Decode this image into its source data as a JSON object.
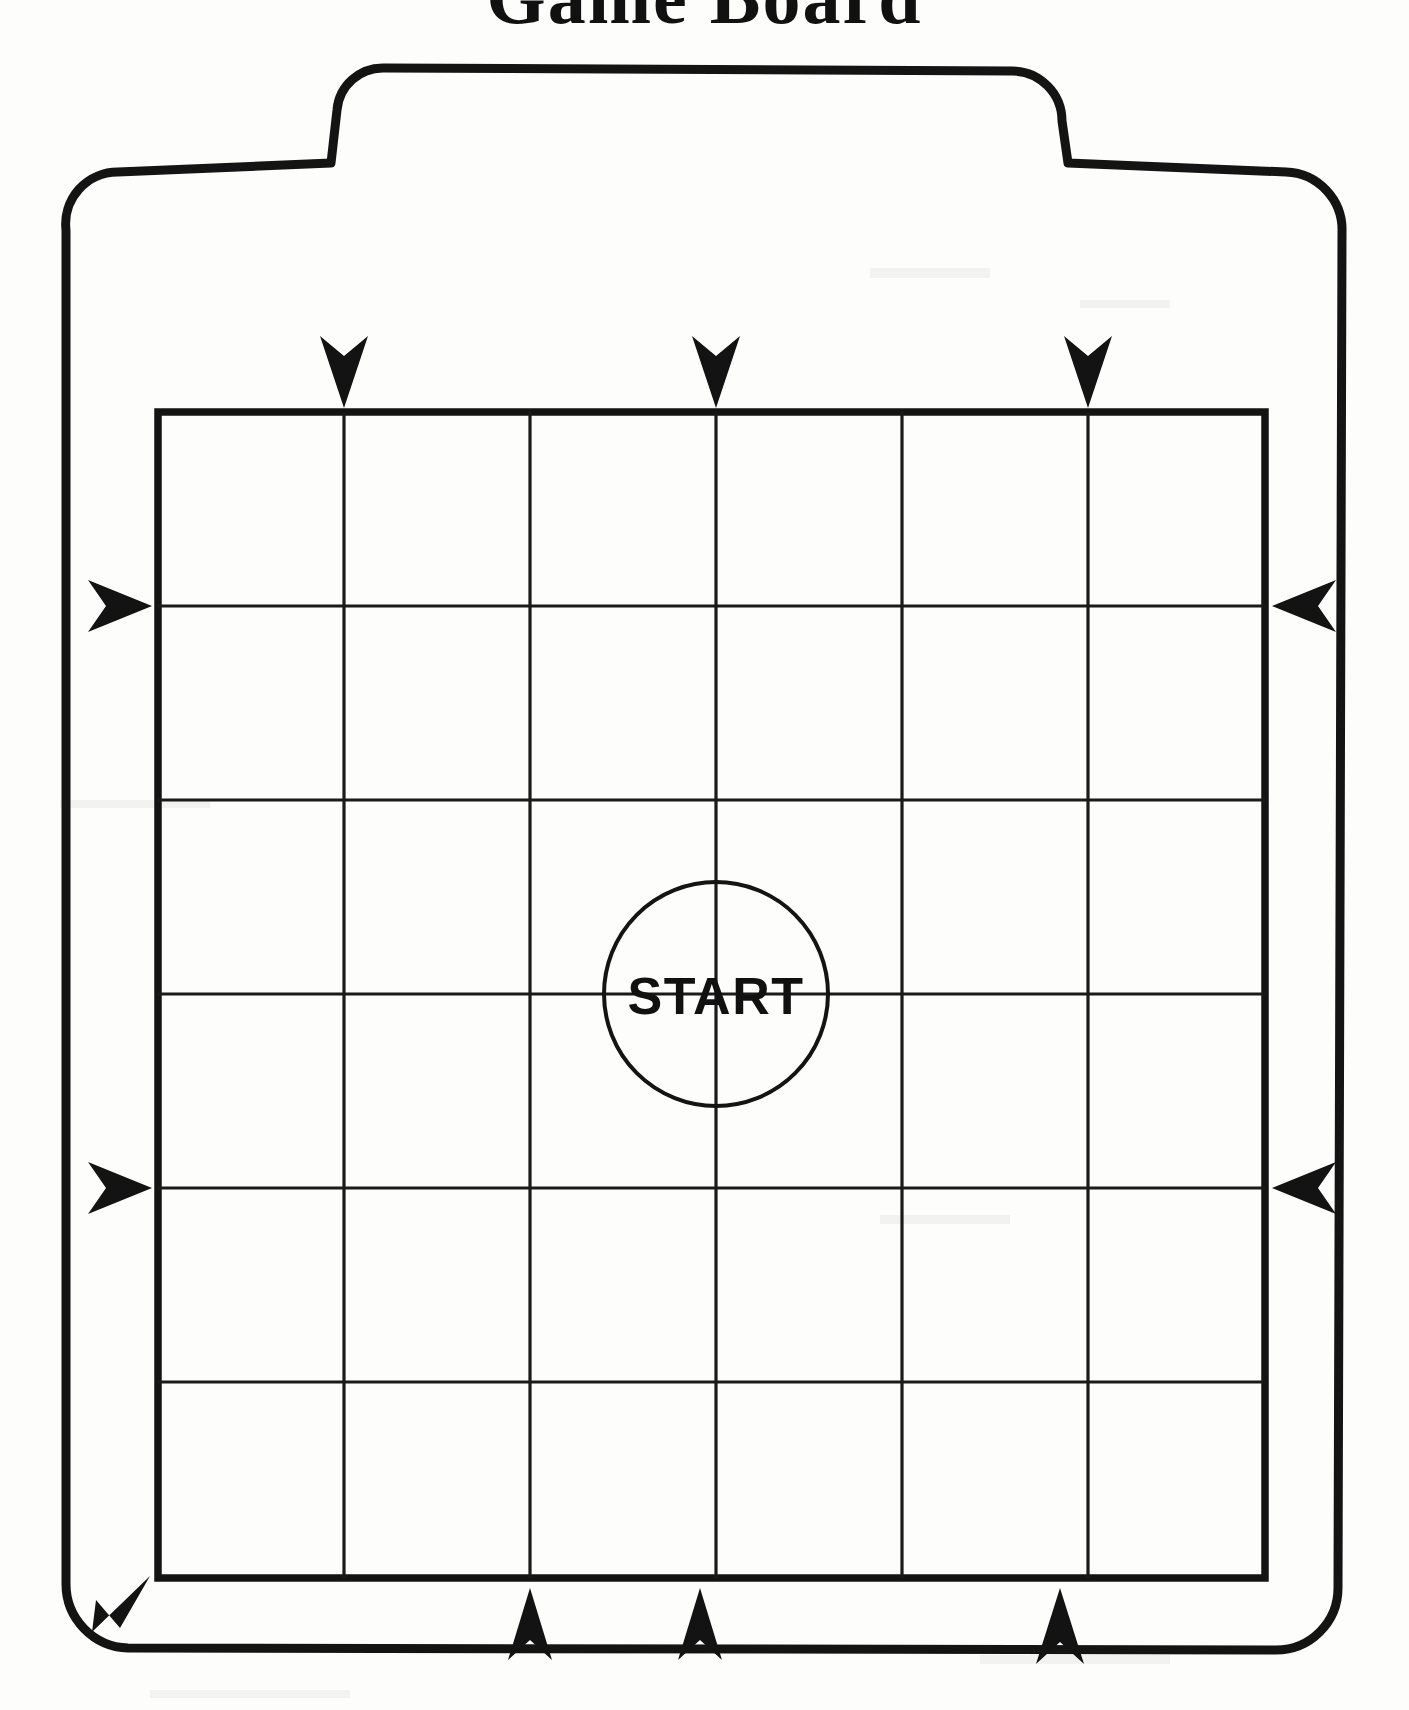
{
  "page": {
    "title": "Game Board",
    "background_color": "#fdfdfc",
    "ink_color": "#141414",
    "width": 1409,
    "height": 1710
  },
  "board": {
    "name": "game-board-outline",
    "shape": "rounded-rectangle-with-top-tab",
    "tab_label": ""
  },
  "grid": {
    "columns": 6,
    "rows": 6,
    "left": 158,
    "top": 412,
    "right": 1265,
    "bottom": 1578,
    "column_x": [
      158,
      344,
      530,
      716,
      902,
      1088,
      1265
    ],
    "row_y": [
      412,
      606,
      800,
      994,
      1188,
      1382,
      1578
    ],
    "line_color": "#1a1a1a"
  },
  "start": {
    "label": "START",
    "center_x": 716,
    "center_y": 994,
    "radius": 112
  },
  "arrows": {
    "top": [
      {
        "name": "arrow-down-col2",
        "x": 344,
        "y": 380,
        "direction": "down"
      },
      {
        "name": "arrow-down-col4",
        "x": 716,
        "y": 380,
        "direction": "down"
      },
      {
        "name": "arrow-down-col6",
        "x": 1088,
        "y": 380,
        "direction": "down"
      }
    ],
    "left": [
      {
        "name": "arrow-right-row2",
        "x": 128,
        "y": 606,
        "direction": "right"
      },
      {
        "name": "arrow-right-row5",
        "x": 128,
        "y": 1188,
        "direction": "right"
      }
    ],
    "right": [
      {
        "name": "arrow-left-row2",
        "x": 1300,
        "y": 606,
        "direction": "left"
      },
      {
        "name": "arrow-left-row5",
        "x": 1300,
        "y": 1188,
        "direction": "left"
      }
    ],
    "bottom": [
      {
        "name": "arrow-up-col2",
        "x": 530,
        "y": 1612,
        "direction": "up"
      },
      {
        "name": "arrow-up-col3",
        "x": 700,
        "y": 1612,
        "direction": "up"
      },
      {
        "name": "arrow-up-col5",
        "x": 1060,
        "y": 1612,
        "direction": "up"
      }
    ],
    "corner": [
      {
        "name": "arrow-diagonal-bottom-left",
        "x": 126,
        "y": 1608,
        "direction": "up-left"
      }
    ]
  }
}
